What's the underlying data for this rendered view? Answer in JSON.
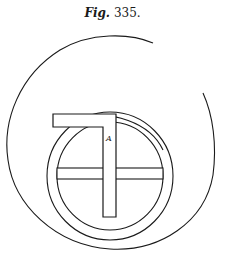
{
  "figure": {
    "caption_prefix": "Fig.",
    "caption_number": "335.",
    "label_a": "A"
  },
  "colors": {
    "ink": "#1a1a1a",
    "background": "#ffffff"
  }
}
